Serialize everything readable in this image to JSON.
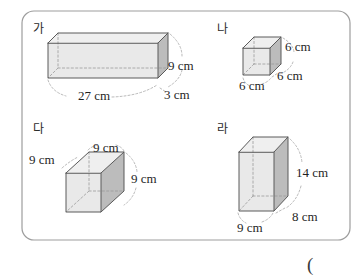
{
  "page": {
    "background_color": "#ffffff",
    "panel": {
      "border_color": "#9d9d9d",
      "x": 22,
      "y": 11,
      "width": 328,
      "height": 229,
      "radius": 12
    },
    "trailing_paren": "("
  },
  "palette": {
    "face_front": "#e9e9e9",
    "face_top": "#efefef",
    "face_side": "#bcbcbc",
    "edge_visible": "#5a5a5a",
    "edge_hidden": "#9a9a9a",
    "leader": "#a8a8a8",
    "text": "#1f1f1f"
  },
  "figures": [
    {
      "id": "ga",
      "label": "가",
      "shape": "rectangular-prism",
      "label_pos": {
        "x": 33,
        "y": 33
      },
      "dimensions": [
        {
          "name": "length",
          "text": "27 cm",
          "value": 27,
          "unit": "cm",
          "x": 78,
          "y": 100
        },
        {
          "name": "height",
          "text": "9 cm",
          "value": 9,
          "unit": "cm",
          "x": 168,
          "y": 70
        },
        {
          "name": "depth",
          "text": "3 cm",
          "value": 3,
          "unit": "cm",
          "x": 164,
          "y": 99
        }
      ]
    },
    {
      "id": "na",
      "label": "나",
      "shape": "cube",
      "label_pos": {
        "x": 217,
        "y": 33
      },
      "dimensions": [
        {
          "name": "height",
          "text": "6 cm",
          "value": 6,
          "unit": "cm",
          "x": 285,
          "y": 51
        },
        {
          "name": "depth",
          "text": "6 cm",
          "value": 6,
          "unit": "cm",
          "x": 277,
          "y": 80
        },
        {
          "name": "width",
          "text": "6 cm",
          "value": 6,
          "unit": "cm",
          "x": 239,
          "y": 90
        }
      ]
    },
    {
      "id": "da",
      "label": "다",
      "shape": "cube",
      "label_pos": {
        "x": 33,
        "y": 133
      },
      "dimensions": [
        {
          "name": "top-depth",
          "text": "9 cm",
          "value": 9,
          "unit": "cm",
          "x": 93,
          "y": 152
        },
        {
          "name": "top-width",
          "text": "9 cm",
          "value": 9,
          "unit": "cm",
          "x": 29,
          "y": 164
        },
        {
          "name": "height",
          "text": "9 cm",
          "value": 9,
          "unit": "cm",
          "x": 131,
          "y": 183
        }
      ]
    },
    {
      "id": "ra",
      "label": "라",
      "shape": "rectangular-prism",
      "label_pos": {
        "x": 217,
        "y": 133
      },
      "dimensions": [
        {
          "name": "height",
          "text": "14 cm",
          "value": 14,
          "unit": "cm",
          "x": 296,
          "y": 177
        },
        {
          "name": "depth",
          "text": "8 cm",
          "value": 8,
          "unit": "cm",
          "x": 292,
          "y": 221
        },
        {
          "name": "width",
          "text": "9 cm",
          "value": 9,
          "unit": "cm",
          "x": 237,
          "y": 232
        }
      ]
    }
  ]
}
